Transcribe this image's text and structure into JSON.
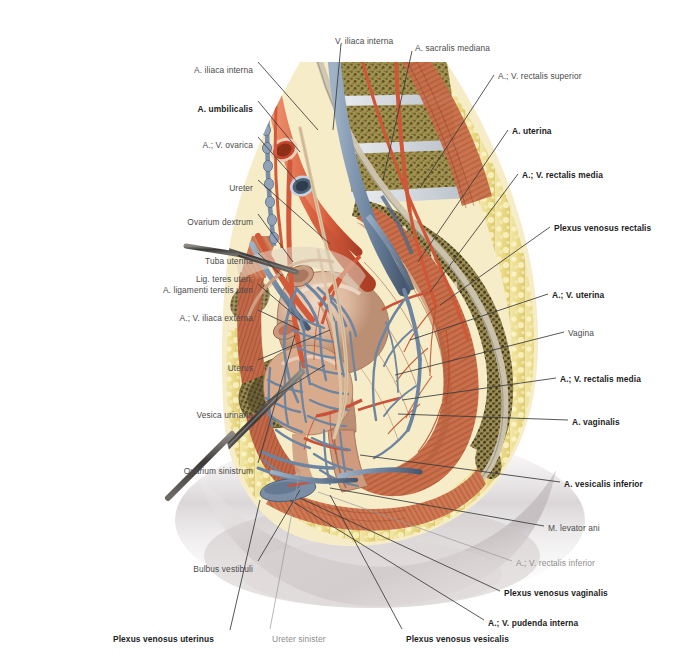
{
  "figure": {
    "type": "anatomical-illustration",
    "background_color": "#ffffff"
  },
  "labels_left": [
    {
      "id": "a-iliaca-interna",
      "text": "A. iliaca interna",
      "bold": false,
      "x": 253,
      "y": 65,
      "lx": 258,
      "ly": 62,
      "tx": 318,
      "ty": 130
    },
    {
      "id": "a-umbilicalis",
      "text": "A. umbilicalis",
      "bold": true,
      "x": 253,
      "y": 104,
      "lx": 258,
      "ly": 101,
      "tx": 300,
      "ty": 152
    },
    {
      "id": "a-v-ovarica",
      "text": "A.; V. ovarica",
      "bold": false,
      "x": 253,
      "y": 140,
      "lx": 258,
      "ly": 137,
      "tx": 300,
      "ty": 185
    },
    {
      "id": "ureter",
      "text": "Ureter",
      "bold": false,
      "x": 253,
      "y": 183,
      "lx": 258,
      "ly": 180,
      "tx": 330,
      "ty": 244
    },
    {
      "id": "ovarium-dextrum",
      "text": "Ovarium dextrum",
      "bold": false,
      "x": 253,
      "y": 217,
      "lx": 258,
      "ly": 214,
      "tx": 293,
      "ty": 262
    },
    {
      "id": "tuba-uterina",
      "text": "Tuba uterina",
      "bold": false,
      "x": 253,
      "y": 256,
      "lx": 258,
      "ly": 253,
      "tx": 282,
      "ty": 276
    },
    {
      "id": "a-v-iliaca-externa",
      "text": "A.; V. iliaca externa",
      "bold": false,
      "x": 253,
      "y": 313,
      "lx": 258,
      "ly": 310,
      "tx": 300,
      "ty": 330
    },
    {
      "id": "uterus",
      "text": "Uterus",
      "bold": false,
      "x": 253,
      "y": 363,
      "lx": 258,
      "ly": 360,
      "tx": 330,
      "ty": 330
    },
    {
      "id": "vesica-urinaria",
      "text": "Vesica urinaria",
      "bold": false,
      "x": 253,
      "y": 410,
      "lx": 258,
      "ly": 407,
      "tx": 325,
      "ty": 365
    },
    {
      "id": "ovarium-sinistrum",
      "text": "Ovarium sinistrum",
      "bold": false,
      "x": 253,
      "y": 466,
      "lx": 258,
      "ly": 463,
      "tx": 295,
      "ty": 335
    },
    {
      "id": "bulbus-vestibuli",
      "text": "Bulbus vestibuli",
      "bold": false,
      "x": 253,
      "y": 564,
      "lx": 258,
      "ly": 561,
      "tx": 300,
      "ty": 490
    }
  ],
  "labels_left_two_line": [
    {
      "id": "lig-teres-uteri",
      "line1": "Lig. teres uteri;",
      "line2": "A. ligamenti teretis uteri",
      "bold": false,
      "x": 253,
      "y": 274,
      "lx": 258,
      "ly": 284,
      "tx": 300,
      "ty": 320
    }
  ],
  "labels_top": [
    {
      "id": "v-iliaca-interna",
      "text": "V. iliaca interna",
      "bold": false,
      "x": 335,
      "y": 36,
      "lx": 341,
      "ly": 44,
      "tx": 333,
      "ty": 130
    },
    {
      "id": "a-sacralis-mediana",
      "text": "A. sacralis mediana",
      "bold": false,
      "x": 415,
      "y": 43,
      "lx": 412,
      "ly": 51,
      "tx": 383,
      "ty": 180
    }
  ],
  "labels_right": [
    {
      "id": "a-v-rectalis-superior",
      "text": "A.; V. rectalis superior",
      "bold": false,
      "faint": false,
      "x": 498,
      "y": 71,
      "lx": 494,
      "ly": 75,
      "tx": 420,
      "ty": 188
    },
    {
      "id": "a-uterina",
      "text": "A. uterina",
      "bold": true,
      "faint": false,
      "x": 512,
      "y": 126,
      "lx": 508,
      "ly": 130,
      "tx": 418,
      "ty": 262
    },
    {
      "id": "a-v-rectalis-media-1",
      "text": "A.; V. rectalis media",
      "bold": true,
      "faint": false,
      "x": 522,
      "y": 170,
      "lx": 518,
      "ly": 174,
      "tx": 430,
      "ty": 292
    },
    {
      "id": "plexus-venosus-rectalis",
      "text": "Plexus venosus rectalis",
      "bold": true,
      "faint": false,
      "x": 554,
      "y": 223,
      "lx": 550,
      "ly": 227,
      "tx": 440,
      "ty": 305
    },
    {
      "id": "a-v-uterina",
      "text": "A.; V. uterina",
      "bold": true,
      "faint": false,
      "x": 552,
      "y": 290,
      "lx": 548,
      "ly": 294,
      "tx": 410,
      "ty": 340
    },
    {
      "id": "vagina",
      "text": "Vagina",
      "bold": false,
      "faint": false,
      "x": 568,
      "y": 328,
      "lx": 564,
      "ly": 332,
      "tx": 395,
      "ty": 375
    },
    {
      "id": "a-v-rectalis-media-2",
      "text": "A.; V. rectalis media",
      "bold": true,
      "faint": false,
      "x": 560,
      "y": 374,
      "lx": 556,
      "ly": 378,
      "tx": 402,
      "ty": 400
    },
    {
      "id": "a-vaginalis",
      "text": "A. vaginalis",
      "bold": true,
      "faint": false,
      "x": 572,
      "y": 417,
      "lx": 568,
      "ly": 420,
      "tx": 398,
      "ty": 414
    },
    {
      "id": "a-vesicalis-inferior",
      "text": "A. vesicalis inferior",
      "bold": true,
      "faint": false,
      "x": 564,
      "y": 479,
      "lx": 560,
      "ly": 482,
      "tx": 360,
      "ty": 455
    },
    {
      "id": "m-levator-ani",
      "text": "M. levator ani",
      "bold": false,
      "faint": false,
      "x": 548,
      "y": 523,
      "lx": 544,
      "ly": 526,
      "tx": 330,
      "ty": 488
    },
    {
      "id": "a-v-rectalis-inferior",
      "text": "A.; V. rectalis inferior",
      "bold": false,
      "faint": true,
      "x": 516,
      "y": 558,
      "lx": 512,
      "ly": 561,
      "tx": 318,
      "ty": 492
    },
    {
      "id": "plexus-venosus-vaginalis",
      "text": "Plexus venosus vaginalis",
      "bold": true,
      "faint": false,
      "x": 504,
      "y": 588,
      "lx": 500,
      "ly": 591,
      "tx": 300,
      "ty": 498
    },
    {
      "id": "a-v-pudenda-interna",
      "text": "A.; V. pudenda interna",
      "bold": true,
      "faint": false,
      "x": 488,
      "y": 618,
      "lx": 484,
      "ly": 620,
      "tx": 290,
      "ty": 500
    }
  ],
  "labels_bottom": [
    {
      "id": "plexus-venosus-uterinus",
      "text": "Plexus venosus uterinus",
      "bold": true,
      "faint": false,
      "x": 113,
      "y": 634,
      "lx": 230,
      "ly": 630,
      "tx": 260,
      "ty": 500
    },
    {
      "id": "ureter-sinister",
      "text": "Ureter sinister",
      "bold": false,
      "faint": true,
      "x": 272,
      "y": 634,
      "lx": 270,
      "ly": 629,
      "tx": 300,
      "ty": 470
    },
    {
      "id": "plexus-venosus-vesicalis",
      "text": "Plexus venosus vesicalis",
      "bold": true,
      "faint": false,
      "x": 406,
      "y": 634,
      "lx": 402,
      "ly": 629,
      "tx": 330,
      "ty": 495
    }
  ],
  "colors": {
    "artery": "#d9603f",
    "vein": "#7a8fa6",
    "bone": "#9a8c5a",
    "fat": "#ead98a",
    "muscle": "#c4714f",
    "organ": "#d9b49a",
    "skin": "#cfc9c6",
    "leader": "#3a3a3a",
    "label_text": "#4a4a4a",
    "label_bold": "#1d1d1d",
    "label_faint": "#8d8d8d"
  }
}
